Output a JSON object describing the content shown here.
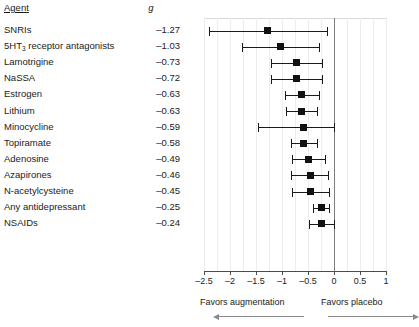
{
  "table": {
    "header_agent": "Agent",
    "header_effect": "g"
  },
  "axis": {
    "ticks": [
      "–2.5",
      "–2",
      "–1.5",
      "–1",
      "–0.5",
      "0",
      "0.5",
      "1"
    ],
    "tick_values": [
      -2.5,
      -2,
      -1.5,
      -1,
      -0.5,
      0,
      0.5,
      1
    ]
  },
  "footer": {
    "left_label": "Favors augmentation",
    "right_label": "Favors placebo",
    "left_arrow": "arrow-left-icon",
    "right_arrow": "arrow-right-icon"
  },
  "colors": {
    "marker": "#111111",
    "ci": "#1a1a1a",
    "zeroline": "#7d7d7d",
    "grid": "#ededed",
    "axis": "#4d4d4d",
    "arrow": "#8a8a8a"
  },
  "chart_data": {
    "type": "scatter",
    "title": "",
    "subtitle": "",
    "xlabel": "",
    "ylabel": "Agent",
    "xlim": [
      -2.5,
      1.0
    ],
    "grid": true,
    "legend": "none",
    "reference_line": 0,
    "effect_measure": "g",
    "xticks": [
      -2.5,
      -2,
      -1.5,
      -1,
      -0.5,
      0,
      0.5,
      1
    ],
    "xticklabels": [
      "–2.5",
      "–2",
      "–1.5",
      "–1",
      "–0.5",
      "0",
      "0.5",
      "1"
    ],
    "annotations": [
      "Favors augmentation",
      "Favors placebo"
    ],
    "categories": [
      "SNRIs",
      "5HT3 receptor antagonists",
      "Lamotrigine",
      "NaSSA",
      "Estrogen",
      "Lithium",
      "Minocycline",
      "Topiramate",
      "Adenosine",
      "Azapirones",
      "N-acetylcysteine",
      "Any antidepressant",
      "NSAIDs"
    ],
    "values": [
      -1.27,
      -1.03,
      -0.73,
      -0.72,
      -0.63,
      -0.63,
      -0.59,
      -0.58,
      -0.49,
      -0.46,
      -0.45,
      -0.25,
      -0.24
    ],
    "rows": [
      {
        "agent": "SNRIs",
        "agent_html": "SNRIs",
        "g": "–1.27",
        "value": -1.27,
        "ci_low": -2.4,
        "ci_high": -0.14
      },
      {
        "agent": "5HT3 receptor antagonists",
        "agent_html": "5HT<sub>3</sub> receptor antagonists",
        "g": "–1.03",
        "value": -1.03,
        "ci_low": -1.76,
        "ci_high": -0.29
      },
      {
        "agent": "Lamotrigine",
        "agent_html": "Lamotrigine",
        "g": "–0.73",
        "value": -0.73,
        "ci_low": -1.22,
        "ci_high": -0.23
      },
      {
        "agent": "NaSSA",
        "agent_html": "NaSSA",
        "g": "–0.72",
        "value": -0.72,
        "ci_low": -1.22,
        "ci_high": -0.23
      },
      {
        "agent": "Estrogen",
        "agent_html": "Estrogen",
        "g": "–0.63",
        "value": -0.63,
        "ci_low": -0.94,
        "ci_high": -0.29
      },
      {
        "agent": "Lithium",
        "agent_html": "Lithium",
        "g": "–0.63",
        "value": -0.63,
        "ci_low": -0.93,
        "ci_high": -0.33
      },
      {
        "agent": "Minocycline",
        "agent_html": "Minocycline",
        "g": "–0.59",
        "value": -0.59,
        "ci_low": -1.47,
        "ci_high": 0.0
      },
      {
        "agent": "Topiramate",
        "agent_html": "Topiramate",
        "g": "–0.58",
        "value": -0.58,
        "ci_low": -0.83,
        "ci_high": -0.33
      },
      {
        "agent": "Adenosine",
        "agent_html": "Adenosine",
        "g": "–0.49",
        "value": -0.49,
        "ci_low": -0.81,
        "ci_high": -0.18
      },
      {
        "agent": "Azapirones",
        "agent_html": "Azapirones",
        "g": "–0.46",
        "value": -0.46,
        "ci_low": -0.82,
        "ci_high": -0.11
      },
      {
        "agent": "N-acetylcysteine",
        "agent_html": "N-acetylcysteine",
        "g": "–0.45",
        "value": -0.45,
        "ci_low": -0.81,
        "ci_high": -0.09
      },
      {
        "agent": "Any antidepressant",
        "agent_html": "Any antidepressant",
        "g": "–0.25",
        "value": -0.25,
        "ci_low": -0.4,
        "ci_high": -0.1
      },
      {
        "agent": "NSAIDs",
        "agent_html": "NSAIDs",
        "g": "–0.24",
        "value": -0.24,
        "ci_low": -0.48,
        "ci_high": 0.0
      }
    ]
  }
}
